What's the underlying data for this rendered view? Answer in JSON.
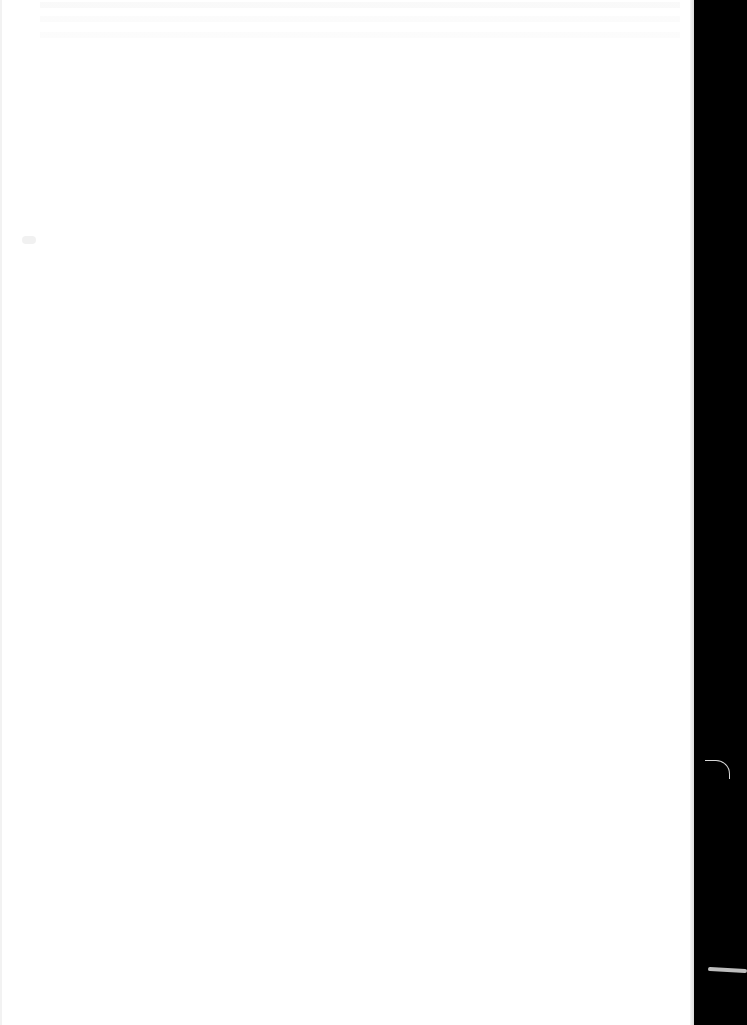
{
  "document": {
    "description": "Scanned blank page",
    "page_text": "",
    "regions": {
      "page": {
        "color": "#ffffff"
      },
      "background_strip": {
        "color": "#000000"
      },
      "bleed_through": {
        "color": "#c8c8c8"
      },
      "fiber_marks": {
        "color": "#d8d8d8"
      }
    }
  }
}
